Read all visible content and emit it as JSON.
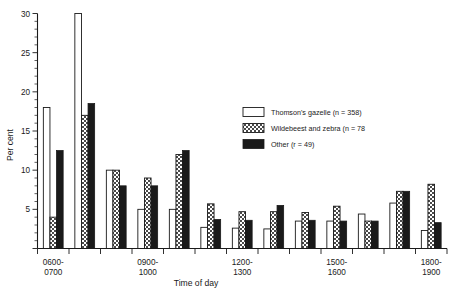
{
  "chart_data": {
    "type": "bar",
    "title": "",
    "xlabel": "Time of day",
    "ylabel": "Per cent",
    "ylim": [
      0,
      30
    ],
    "yticks": [
      0,
      5,
      10,
      15,
      20,
      25,
      30
    ],
    "ytick_labels": [
      "",
      "5",
      "10",
      "15",
      "20",
      "25",
      "30"
    ],
    "grid": false,
    "legend_position": "upper-right",
    "categories": [
      "0600-0700",
      "0700-0800",
      "0800-0900",
      "0900-1000",
      "1000-1100",
      "1100-1200",
      "1200-1300",
      "1300-1400",
      "1400-1500",
      "1500-1600",
      "1600-1700",
      "1700-1800",
      "1800-1900"
    ],
    "xtick_labels_shown": [
      "0600-\n0700",
      "0900-\n1000",
      "1200-\n1300",
      "1500-\n1600",
      "1800-\n1900"
    ],
    "xtick_label_lines": [
      [
        "0600-",
        "0700"
      ],
      [
        "0900-",
        "1000"
      ],
      [
        "1200-",
        "1300"
      ],
      [
        "1500-",
        "1600"
      ],
      [
        "1800-",
        "1900"
      ]
    ],
    "xtick_label_indices": [
      0,
      3,
      6,
      9,
      12
    ],
    "series": [
      {
        "name": "Thomson's gazelle (n = 358)",
        "fill": "white",
        "values": [
          18,
          30,
          10,
          5,
          5,
          2.7,
          2.6,
          2.5,
          3.5,
          3.5,
          4.4,
          5.8,
          2.3
        ]
      },
      {
        "name": "Wildebeest and zebra (n = 78",
        "fill": "hatched",
        "values": [
          4,
          17,
          10,
          9,
          12,
          5.7,
          4.7,
          4.7,
          4.6,
          5.4,
          3.5,
          7.3,
          8.2
        ]
      },
      {
        "name": "Other (r = 49)",
        "fill": "black",
        "values": [
          12.5,
          18.5,
          8,
          8,
          12.5,
          3.7,
          3.6,
          5.5,
          3.6,
          3.5,
          3.5,
          7.3,
          3.3
        ]
      }
    ]
  },
  "legend": {
    "items": [
      {
        "label": "Thomson's gazelle (n = 358)",
        "swatch": "white"
      },
      {
        "label": "Wildebeest and zebra (n = 78",
        "swatch": "hatched"
      },
      {
        "label": "Other (r = 49)",
        "swatch": "black"
      }
    ]
  },
  "axes": {
    "y_title": "Per cent",
    "x_title": "Time of day"
  },
  "colors": {
    "ink": "#1a1a1a",
    "paper": "#ffffff",
    "hatch_fill": "#d9d9d9"
  }
}
